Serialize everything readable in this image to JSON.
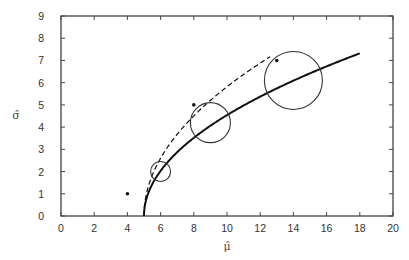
{
  "chart_data": {
    "type": "line",
    "title": "",
    "xlabel": "μ̂",
    "ylabel": "σ̂",
    "xlim": [
      0,
      20
    ],
    "ylim": [
      0,
      9
    ],
    "xticks": [
      0,
      2,
      4,
      6,
      8,
      10,
      12,
      14,
      16,
      18,
      20
    ],
    "yticks": [
      0,
      1,
      2,
      3,
      4,
      5,
      6,
      7,
      8,
      9
    ],
    "grid": false,
    "legend": null,
    "series": [
      {
        "name": "solid curve",
        "style": "solid",
        "function": "sigma = 2.03*sqrt(mu - 5)",
        "x": [
          5,
          5.05,
          5.2,
          5.5,
          6,
          7,
          8,
          9,
          10,
          11,
          12,
          13,
          14,
          15,
          16,
          17,
          18
        ],
        "y": [
          0,
          0.45,
          0.89,
          1.44,
          2.03,
          2.87,
          3.52,
          4.06,
          4.54,
          4.97,
          5.37,
          5.74,
          6.09,
          6.42,
          6.73,
          7.03,
          7.32
        ]
      },
      {
        "name": "dashed curve",
        "style": "dashed",
        "function": "sigma = 2.6*sqrt(mu - 5)",
        "x": [
          5,
          5.05,
          5.2,
          5.5,
          6,
          7,
          8,
          9,
          10,
          11,
          12,
          12.6
        ],
        "y": [
          0,
          0.58,
          1.16,
          1.84,
          2.6,
          3.68,
          4.5,
          5.2,
          5.81,
          6.37,
          6.88,
          7.17
        ]
      }
    ],
    "points": [
      {
        "x": 4,
        "y": 1
      },
      {
        "x": 8,
        "y": 5
      },
      {
        "x": 13,
        "y": 7
      }
    ],
    "circles": [
      {
        "cx": 6,
        "cy": 2.0,
        "r_px": 10
      },
      {
        "cx": 9,
        "cy": 4.2,
        "r_px": 20
      },
      {
        "cx": 14,
        "cy": 6.1,
        "r_px": 29
      }
    ]
  }
}
